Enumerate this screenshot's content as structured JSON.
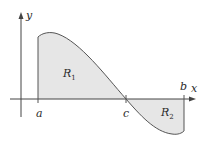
{
  "diagram": {
    "type": "area-between-curve-and-axis",
    "axes": {
      "x_label": "x",
      "y_label": "y"
    },
    "points": {
      "a_label": "a",
      "b_label": "b",
      "c_label": "c"
    },
    "regions": [
      {
        "name": "R",
        "subscript": "1",
        "position": "above x-axis, from a to c"
      },
      {
        "name": "R",
        "subscript": "2",
        "position": "below x-axis, from c to b"
      }
    ],
    "colors": {
      "fill": "#e6e6e6",
      "stroke": "#555555",
      "axis": "#444444"
    }
  }
}
